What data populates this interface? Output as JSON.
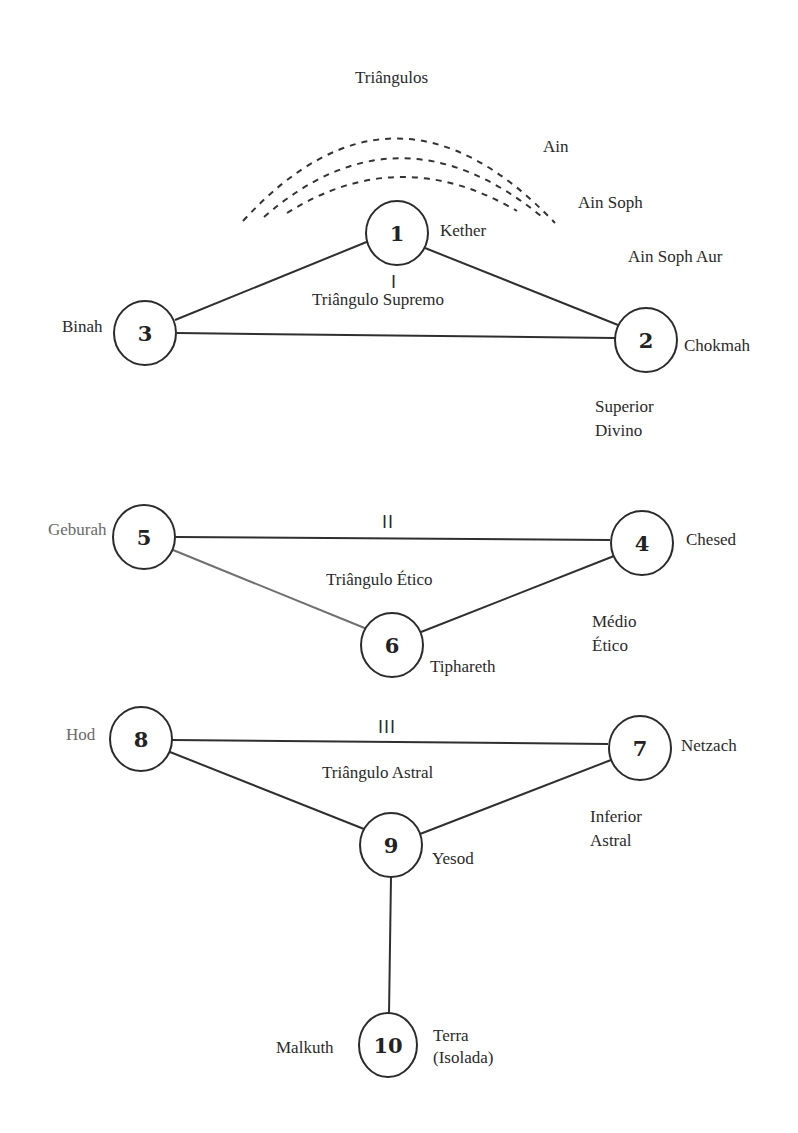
{
  "title": "Triângulos",
  "ain_labels": [
    "Ain",
    "Ain Soph",
    "Ain Soph Aur"
  ],
  "nodes": [
    {
      "id": "1",
      "number": "1",
      "name": "Kether"
    },
    {
      "id": "2",
      "number": "2",
      "name": "Chokmah"
    },
    {
      "id": "3",
      "number": "3",
      "name": "Binah"
    },
    {
      "id": "4",
      "number": "4",
      "name": "Chesed"
    },
    {
      "id": "5",
      "number": "5",
      "name": "Geburah"
    },
    {
      "id": "6",
      "number": "6",
      "name": "Tiphareth"
    },
    {
      "id": "7",
      "number": "7",
      "name": "Netzach"
    },
    {
      "id": "8",
      "number": "8",
      "name": "Hod"
    },
    {
      "id": "9",
      "number": "9",
      "name": "Yesod"
    },
    {
      "id": "10",
      "number": "10",
      "name": "Malkuth"
    }
  ],
  "triangles": [
    {
      "roman": "I",
      "name": "Triângulo Supremo",
      "level_line1": "Superior",
      "level_line2": "Divino"
    },
    {
      "roman": "II",
      "name": "Triângulo Ético",
      "level_line1": "Médio",
      "level_line2": "Ético"
    },
    {
      "roman": "III",
      "name": "Triângulo Astral",
      "level_line1": "Inferior",
      "level_line2": "Astral"
    }
  ],
  "earth": {
    "line1": "Terra",
    "line2": "(Isolada)"
  },
  "edges": [
    [
      "1",
      "2"
    ],
    [
      "1",
      "3"
    ],
    [
      "3",
      "2"
    ],
    [
      "5",
      "4"
    ],
    [
      "5",
      "6"
    ],
    [
      "6",
      "4"
    ],
    [
      "8",
      "7"
    ],
    [
      "8",
      "9"
    ],
    [
      "9",
      "7"
    ],
    [
      "9",
      "10"
    ]
  ]
}
